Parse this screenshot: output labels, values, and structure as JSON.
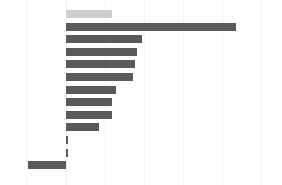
{
  "chart_data": {
    "type": "bar",
    "orientation": "horizontal",
    "title": "",
    "subtitle": "",
    "xlabel": "",
    "ylabel": "",
    "grid": true,
    "legend": false,
    "legend_position": "none",
    "xlim": [
      -1.0,
      4.5
    ],
    "xticks": [
      -1.0,
      0.0,
      1.0,
      2.0,
      3.0,
      4.0,
      5.0
    ],
    "xticklabels": [
      "",
      "",
      "",
      "",
      "",
      "",
      ""
    ],
    "categories": [
      "",
      "",
      "",
      "",
      "",
      "",
      "",
      "",
      "",
      "",
      "",
      "",
      ""
    ],
    "values": [
      1.18,
      4.36,
      1.95,
      1.82,
      1.77,
      1.72,
      1.28,
      1.18,
      1.18,
      0.85,
      0.05,
      0.05,
      -0.97
    ],
    "bar_colors": [
      "#cfcfcf",
      "#5a5a5a",
      "#5a5a5a",
      "#5a5a5a",
      "#5a5a5a",
      "#5a5a5a",
      "#5a5a5a",
      "#5a5a5a",
      "#5a5a5a",
      "#5a5a5a",
      "#5a5a5a",
      "#5a5a5a",
      "#5a5a5a"
    ],
    "highlight_index": 0,
    "background_color": "#ffffff",
    "gridline_color": "#f2f2f2",
    "bar_color": "#5a5a5a",
    "highlight_color": "#cfcfcf"
  },
  "geometry": {
    "width": 282,
    "height": 185,
    "zero_x": 66,
    "px_per_unit": 39,
    "bar_height": 8,
    "row_pitch": 12.6,
    "first_row_top": 10,
    "gridline_xs": [
      27,
      66,
      105,
      144,
      183,
      222,
      261
    ]
  }
}
